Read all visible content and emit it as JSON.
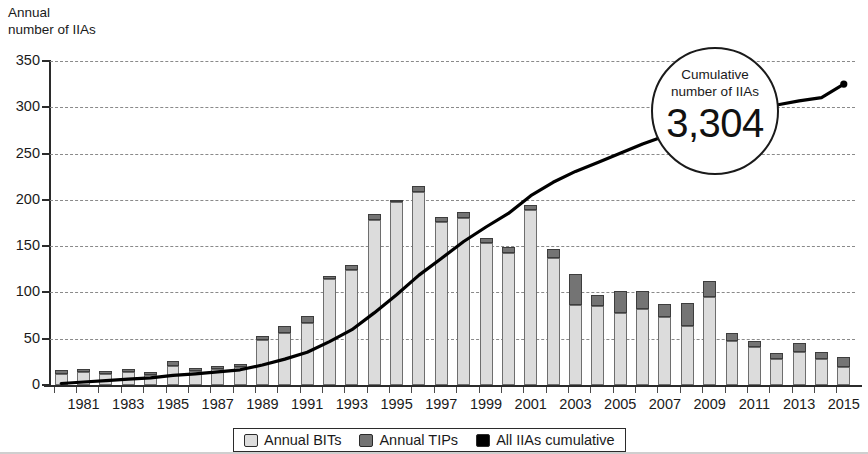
{
  "axis_title": "Annual\nnumber of IIAs",
  "callout": {
    "label": "Cumulative\nnumber of IIAs",
    "value": "3,304"
  },
  "legend": {
    "items": [
      {
        "label": "Annual BITs",
        "swatch": "light-gray-square-icon",
        "color": "#dcdcdc"
      },
      {
        "label": "Annual TIPs",
        "swatch": "dark-gray-square-icon",
        "color": "#747474"
      },
      {
        "label": "All IIAs cumulative",
        "swatch": "black-square-icon",
        "color": "#000000"
      }
    ]
  },
  "chart_data": {
    "type": "bar",
    "title": "",
    "subtitle": "",
    "xlabel": "",
    "ylabel": "Annual number of IIAs",
    "ylim": [
      0,
      350
    ],
    "ytick_step": 50,
    "yticks": [
      0,
      50,
      100,
      150,
      200,
      250,
      300,
      350
    ],
    "grid": true,
    "legend_position": "bottom",
    "stacked": true,
    "categories": [
      "1980",
      "1981",
      "1982",
      "1983",
      "1984",
      "1985",
      "1986",
      "1987",
      "1988",
      "1989",
      "1990",
      "1991",
      "1992",
      "1993",
      "1994",
      "1995",
      "1996",
      "1997",
      "1998",
      "1999",
      "2000",
      "2001",
      "2002",
      "2003",
      "2004",
      "2005",
      "2006",
      "2007",
      "2008",
      "2009",
      "2010",
      "2011",
      "2012",
      "2013",
      "2014",
      "2015"
    ],
    "xtick_labels": [
      "1981",
      "1983",
      "1985",
      "1987",
      "1989",
      "1991",
      "1993",
      "1995",
      "1997",
      "1999",
      "2001",
      "2003",
      "2005",
      "2007",
      "2009",
      "2011",
      "2013",
      "2015"
    ],
    "series": [
      {
        "name": "Annual BITs",
        "color": "#dcdcdc",
        "values": [
          12,
          14,
          12,
          14,
          11,
          21,
          15,
          17,
          19,
          49,
          56,
          67,
          114,
          124,
          178,
          198,
          209,
          176,
          180,
          153,
          143,
          189,
          137,
          86,
          85,
          78,
          82,
          73,
          64,
          95,
          48,
          41,
          28,
          36,
          28,
          20
        ]
      },
      {
        "name": "Annual TIPs",
        "color": "#747474",
        "values": [
          4,
          3,
          3,
          3,
          3,
          5,
          3,
          4,
          4,
          4,
          8,
          8,
          4,
          6,
          7,
          2,
          6,
          6,
          7,
          6,
          6,
          6,
          10,
          34,
          12,
          24,
          20,
          15,
          25,
          17,
          8,
          7,
          7,
          9,
          8,
          10
        ]
      }
    ],
    "line_series": {
      "name": "All IIAs cumulative",
      "color": "#000000",
      "values": [
        16,
        33,
        48,
        65,
        79,
        105,
        123,
        144,
        167,
        220,
        284,
        359,
        477,
        607,
        792,
        992,
        1207,
        1389,
        1576,
        1735,
        1884,
        2079,
        2226,
        2346,
        2443,
        2545,
        2647,
        2735,
        2824,
        2936,
        2992,
        3040,
        3075,
        3120,
        3156,
        3304
      ],
      "secondary_axis": false,
      "end_value": 3304,
      "end_marker": true
    }
  }
}
